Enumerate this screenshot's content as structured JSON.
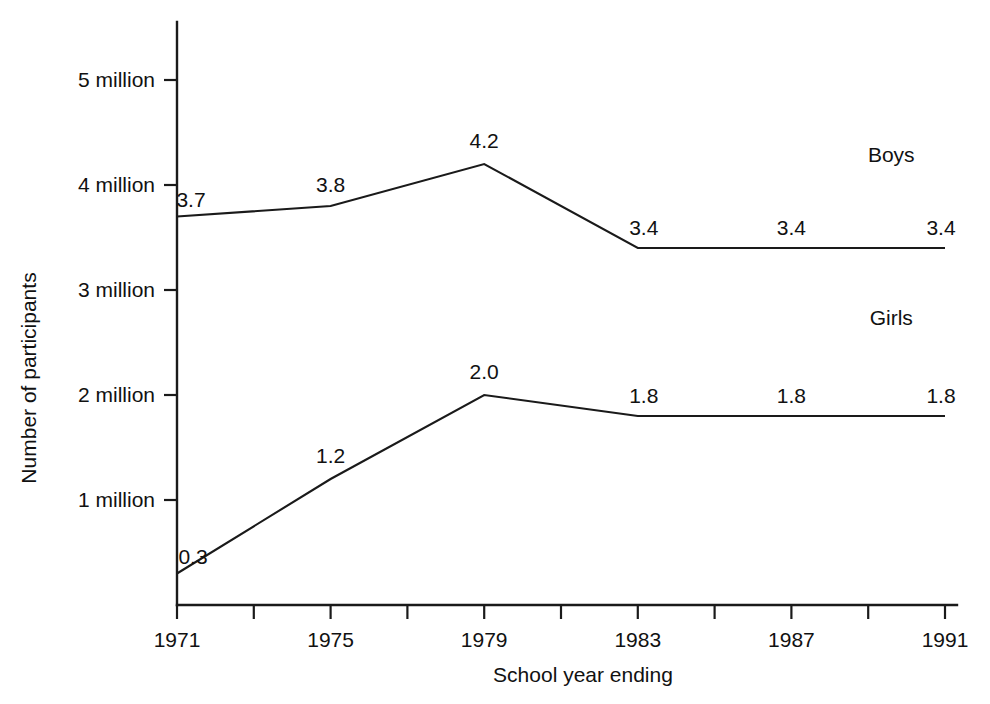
{
  "figure": {
    "background_color": "#ffffff",
    "ink_color": "#1a1a1a"
  },
  "chart_data": {
    "type": "line",
    "title": "",
    "xlabel": "School year ending",
    "ylabel": "Number of participants",
    "x": [
      1971,
      1975,
      1979,
      1983,
      1987,
      1991
    ],
    "xlim": [
      1971,
      1991
    ],
    "ylim": [
      0,
      5.3
    ],
    "grid": false,
    "legend_position": "inline-right",
    "x_tick_values": [
      1971,
      1973,
      1975,
      1977,
      1979,
      1981,
      1983,
      1985,
      1987,
      1989,
      1991
    ],
    "x_tick_labels": [
      "1971",
      "",
      "1975",
      "",
      "1979",
      "",
      "1983",
      "",
      "1987",
      "",
      "1991"
    ],
    "x_labeled_ticks": [
      {
        "value": 1971,
        "label": "1971"
      },
      {
        "value": 1975,
        "label": "1975"
      },
      {
        "value": 1979,
        "label": "1979"
      },
      {
        "value": 1983,
        "label": "1983"
      },
      {
        "value": 1987,
        "label": "1987"
      },
      {
        "value": 1991,
        "label": "1991"
      }
    ],
    "y_tick_values": [
      1,
      2,
      3,
      4,
      5
    ],
    "y_tick_labels": [
      "1 million",
      "2 million",
      "3 million",
      "4 million",
      "5 million"
    ],
    "units": "millions of participants",
    "series": [
      {
        "name": "Boys",
        "values": [
          3.7,
          3.8,
          4.2,
          3.4,
          3.4,
          3.4
        ],
        "point_labels": [
          "3.7",
          "3.8",
          "4.2",
          "3.4",
          "3.4",
          "3.4"
        ],
        "label_x": 1989.6,
        "label_y": 4.22
      },
      {
        "name": "Girls",
        "values": [
          0.3,
          1.2,
          2.0,
          1.8,
          1.8,
          1.8
        ],
        "point_labels": [
          "0.3",
          "1.2",
          "2.0",
          "1.8",
          "1.8",
          "1.8"
        ],
        "label_x": 1989.6,
        "label_y": 2.67
      }
    ]
  }
}
